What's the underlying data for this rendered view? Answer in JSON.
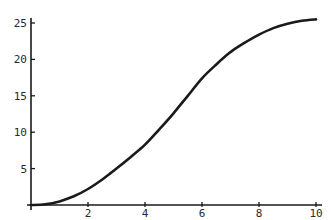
{
  "chart_data": {
    "type": "line",
    "title": "",
    "xlabel": "",
    "ylabel": "",
    "xlim": [
      0,
      10
    ],
    "ylim": [
      0,
      25.5
    ],
    "grid": false,
    "legend": null,
    "x_ticks": [
      2,
      4,
      6,
      8,
      10
    ],
    "y_ticks": [
      5,
      10,
      15,
      20,
      25
    ],
    "series": [
      {
        "name": "curve",
        "color": "#1a1a1a",
        "x": [
          0,
          0.5,
          1,
          1.5,
          2,
          2.5,
          3,
          3.5,
          4,
          4.5,
          5,
          5.5,
          6,
          6.5,
          7,
          7.5,
          8,
          8.5,
          9,
          9.5,
          10
        ],
        "y": [
          0,
          0.1,
          0.5,
          1.2,
          2.2,
          3.5,
          5.0,
          6.6,
          8.3,
          10.4,
          12.6,
          15.0,
          17.4,
          19.3,
          21.0,
          22.3,
          23.4,
          24.3,
          24.9,
          25.3,
          25.5
        ]
      }
    ]
  },
  "colors": {
    "axis": "#1a1a1a",
    "line": "#1a1a1a",
    "background": "#ffffff"
  }
}
